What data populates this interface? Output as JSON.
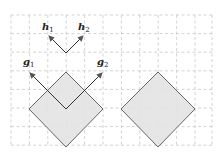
{
  "diagram": {
    "type": "vector-geometry",
    "grid": {
      "x0": 11,
      "x1": 212,
      "y0": 15,
      "y1": 146,
      "step": 18.6,
      "color": "#c8c8c8"
    },
    "shapes": [
      {
        "name": "left-diamond",
        "points": [
          [
            66,
            72
          ],
          [
            103,
            109
          ],
          [
            66,
            147
          ],
          [
            29,
            109
          ]
        ],
        "fill": "#e3e3e3",
        "stroke": "#555555"
      },
      {
        "name": "right-diamond",
        "points": [
          [
            158,
            72
          ],
          [
            195,
            109
          ],
          [
            158,
            147
          ],
          [
            121,
            109
          ]
        ],
        "fill": "#e3e3e3",
        "stroke": "#555555"
      }
    ],
    "arrows": [
      {
        "name": "h1",
        "from": [
          66,
          53
        ],
        "to": [
          48,
          35
        ]
      },
      {
        "name": "h2",
        "from": [
          66,
          53
        ],
        "to": [
          84,
          35
        ]
      },
      {
        "name": "g1",
        "from": [
          66,
          109
        ],
        "to": [
          29,
          72
        ]
      },
      {
        "name": "g2",
        "from": [
          66,
          109
        ],
        "to": [
          103,
          72
        ]
      }
    ],
    "labels": {
      "h1": {
        "base": "h",
        "sub": "1"
      },
      "h2": {
        "base": "h",
        "sub": "2"
      },
      "g1": {
        "base": "g",
        "sub": "1"
      },
      "g2": {
        "base": "g",
        "sub": "2"
      }
    },
    "colors": {
      "arrow": "#333333",
      "arrowhead": "#555555"
    }
  }
}
